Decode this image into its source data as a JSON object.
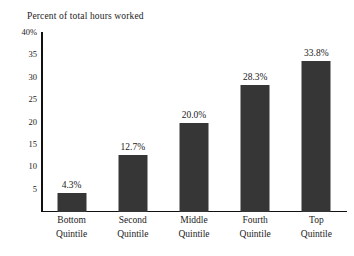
{
  "chart_data": {
    "type": "bar",
    "title": "Percent of total hours worked",
    "xlabel": "",
    "ylabel": "",
    "ylim": [
      0,
      40
    ],
    "grid": false,
    "legend": null,
    "categories": [
      "Bottom Quintile",
      "Second Quintile",
      "Middle Quintile",
      "Fourth Quintile",
      "Top Quintile"
    ],
    "category_lines": [
      [
        "Bottom",
        "Quintile"
      ],
      [
        "Second",
        "Quintile"
      ],
      [
        "Middle",
        "Quintile"
      ],
      [
        "Fourth",
        "Quintile"
      ],
      [
        "Top",
        "Quintile"
      ]
    ],
    "values": [
      4.3,
      12.7,
      20.0,
      28.3,
      33.8
    ],
    "value_labels": [
      "4.3%",
      "12.7%",
      "20.0%",
      "28.3%",
      "33.8%"
    ],
    "y_ticks": [
      40,
      35,
      30,
      25,
      20,
      15,
      10,
      5
    ],
    "y_tick_labels": [
      "40%",
      "35",
      "30",
      "25",
      "20",
      "15",
      "10",
      "5"
    ],
    "bar_color": "#363636",
    "axis_color": "#111111",
    "text_color": "#1b1b1b",
    "background_color": "#ffffff"
  },
  "source_note": ""
}
